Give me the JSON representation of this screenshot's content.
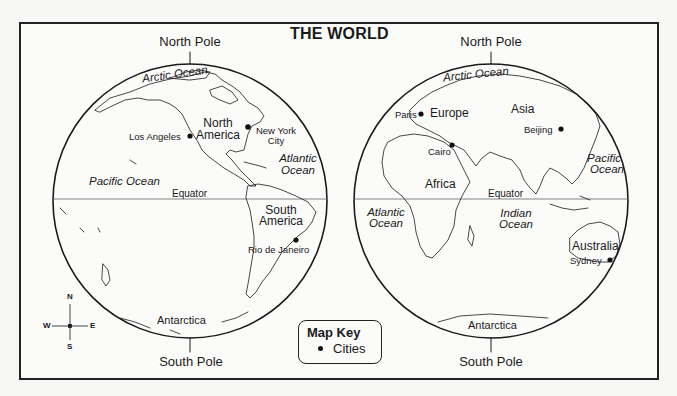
{
  "title": "THE WORLD",
  "colors": {
    "ink": "#1a1a1a",
    "paper": "#fbfbfa",
    "background": "#f7f7f5"
  },
  "hemispheres": [
    {
      "name": "western",
      "north_pole_label": "North Pole",
      "south_pole_label": "South Pole",
      "equator_label": "Equator",
      "continents": [
        "North America",
        "South America",
        "Antarctica"
      ],
      "oceans": [
        "Arctic Ocean",
        "Pacific Ocean",
        "Atlantic Ocean"
      ],
      "cities": [
        "Los Angeles",
        "New York City",
        "Rio de Janeiro"
      ]
    },
    {
      "name": "eastern",
      "north_pole_label": "North Pole",
      "south_pole_label": "South Pole",
      "equator_label": "Equator",
      "continents": [
        "Europe",
        "Asia",
        "Africa",
        "Australia",
        "Antarctica"
      ],
      "oceans": [
        "Arctic Ocean",
        "Pacific Ocean",
        "Atlantic Ocean",
        "Indian Ocean"
      ],
      "cities": [
        "Paris",
        "Beijing",
        "Cairo",
        "Sydney"
      ]
    }
  ],
  "labels": {
    "west": {
      "north_pole": "North Pole",
      "south_pole": "South Pole",
      "arctic": "Arctic Ocean",
      "north_america_1": "North",
      "north_america_2": "America",
      "los_angeles": "Los Angeles",
      "nyc_1": "New York",
      "nyc_2": "City",
      "atlantic_1": "Atlantic",
      "atlantic_2": "Ocean",
      "pacific": "Pacific Ocean",
      "equator": "Equator",
      "south_america_1": "South",
      "south_america_2": "America",
      "rio": "Rio de Janeiro",
      "antarctica": "Antarctica"
    },
    "east": {
      "north_pole": "North Pole",
      "south_pole": "South Pole",
      "arctic": "Arctic Ocean",
      "paris": "Paris",
      "europe": "Europe",
      "asia": "Asia",
      "beijing": "Beijing",
      "cairo": "Cairo",
      "pacific_1": "Pacific",
      "pacific_2": "Ocean",
      "africa": "Africa",
      "equator": "Equator",
      "atlantic_1": "Atlantic",
      "atlantic_2": "Ocean",
      "indian_1": "Indian",
      "indian_2": "Ocean",
      "australia": "Australia",
      "sydney": "Sydney",
      "antarctica": "Antarctica"
    }
  },
  "compass": {
    "n": "N",
    "s": "S",
    "e": "E",
    "w": "W",
    "icon": "compass-rose-icon"
  },
  "map_key": {
    "title": "Map Key",
    "items": [
      {
        "symbol": "city-dot-icon",
        "label": "Cities"
      }
    ]
  }
}
